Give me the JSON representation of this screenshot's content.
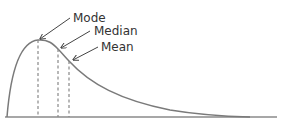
{
  "diagram": {
    "labels": {
      "mode": "Mode",
      "median": "Median",
      "mean": "Mean"
    },
    "colors": {
      "curve": "#7a7a7a",
      "axis": "#8a8a8a",
      "dashed": "#888888",
      "arrow": "#444444",
      "text": "#333333"
    }
  }
}
